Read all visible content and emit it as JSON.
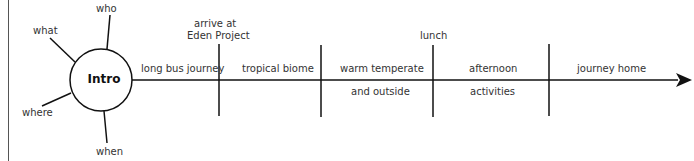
{
  "diagram": {
    "hub": {
      "label": "Intro",
      "spokes": [
        "who",
        "what",
        "where",
        "when"
      ]
    },
    "timeline": {
      "segments": [
        {
          "label_above": "long bus journey",
          "label_below": ""
        },
        {
          "label_above": "tropical biome",
          "label_below": ""
        },
        {
          "label_above": "warm temperate",
          "label_below": "and outside"
        },
        {
          "label_above": "afternoon",
          "label_below": "activities"
        },
        {
          "label_above": "journey home",
          "label_below": ""
        }
      ],
      "markers": [
        {
          "label": "arrive at Eden Project",
          "line1": "arrive at",
          "line2": "Eden Project"
        },
        {
          "label": ""
        },
        {
          "label": "lunch"
        },
        {
          "label": ""
        }
      ]
    }
  }
}
